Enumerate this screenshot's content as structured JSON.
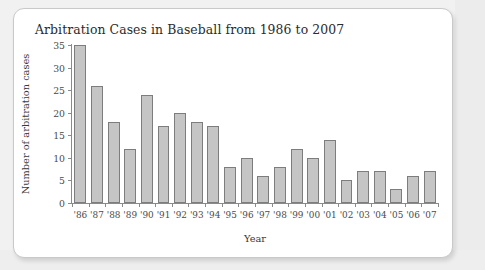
{
  "chart_data": {
    "type": "bar",
    "title": "Arbitration Cases in Baseball from 1986 to 2007",
    "xlabel": "Year",
    "ylabel": "Number of arbitration cases",
    "categories": [
      "'86",
      "'87",
      "'88",
      "'89",
      "'90",
      "'91",
      "'92",
      "'93",
      "'94",
      "'95",
      "'96",
      "'97",
      "'98",
      "'99",
      "'00",
      "'01",
      "'02",
      "'03",
      "'04",
      "'05",
      "'06",
      "'07"
    ],
    "values": [
      35,
      26,
      18,
      12,
      24,
      17,
      20,
      18,
      17,
      8,
      10,
      6,
      8,
      12,
      10,
      14,
      5,
      7,
      7,
      3,
      6,
      7
    ],
    "ylim": [
      0,
      35
    ],
    "yticks": [
      0,
      5,
      10,
      15,
      20,
      25,
      30,
      35
    ],
    "ytick_labels": [
      "0",
      "5",
      "10",
      "15",
      "20",
      "25",
      "30",
      "35"
    ],
    "grid": false,
    "legend": "none",
    "bar_color": "#c5c5c5",
    "bar_edge_color": "#7d7d7d",
    "axis_color": "#8a8a8a",
    "text_color": "#3a3a3a",
    "background": "#ffffff",
    "page_background": "#f1f1f1"
  }
}
